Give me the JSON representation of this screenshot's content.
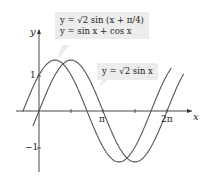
{
  "chart_data": {
    "type": "line",
    "title": "",
    "xlabel": "x",
    "ylabel": "y",
    "xlim": [
      -0.8,
      7.2
    ],
    "ylim": [
      -1.6,
      1.8
    ],
    "x_ticks": [
      {
        "value": 3.14159,
        "label": "π"
      },
      {
        "value": 6.28318,
        "label": "2π"
      }
    ],
    "y_ticks": [
      {
        "value": 1,
        "label": "1"
      },
      {
        "value": -1,
        "label": "−1"
      }
    ],
    "grid": false,
    "series": [
      {
        "name": "y = √2 sin(x + π/4) = sin x + cos x",
        "function": "sqrt(2)*sin(x+pi/4)",
        "x_range": [
          -0.8,
          6.5
        ],
        "color": "#555555"
      },
      {
        "name": "y = √2 sin x",
        "function": "sqrt(2)*sin(x)",
        "x_range": [
          -0.3,
          7.1
        ],
        "color": "#555555"
      }
    ],
    "annotations": [
      {
        "text": "y = √2 sin(x + π/4)",
        "line2": "y = sin x + cos x",
        "target_series": 0
      },
      {
        "text": "y = √2 sin x",
        "target_series": 1
      }
    ]
  },
  "labels": {
    "x_axis": "x",
    "y_axis": "y",
    "tick_pi": "π",
    "tick_2pi": "2π",
    "tick_1": "1",
    "tick_neg1": "−1",
    "callout1_line1": "y = √2 sin (x + π/4)",
    "callout1_line2": "y = sin x + cos x",
    "callout2": "y = √2 sin x"
  }
}
